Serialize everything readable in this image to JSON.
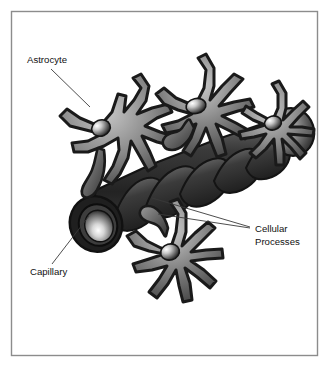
{
  "figure": {
    "border_color": "#8c8c8c",
    "background_color": "#ffffff",
    "labels": [
      {
        "id": "astrocyte",
        "text": "Astrocyte",
        "x": 27,
        "y": 63
      },
      {
        "id": "capillary",
        "text": "Capillary",
        "x": 30,
        "y": 275
      },
      {
        "id": "cellular-processes-line1",
        "text": "Cellular",
        "x": 255,
        "y": 232
      },
      {
        "id": "cellular-processes-line2",
        "text": "Processes",
        "x": 255,
        "y": 245
      }
    ],
    "leader_lines": [
      {
        "id": "astrocyte-leader",
        "x1": 51,
        "y1": 69,
        "x2": 90,
        "y2": 107
      },
      {
        "id": "capillary-leader",
        "x1": 52,
        "y1": 264,
        "x2": 89,
        "y2": 216
      },
      {
        "id": "processes-leader-upper",
        "x1": 250,
        "y1": 227,
        "x2": 152,
        "y2": 198
      },
      {
        "id": "processes-leader-lower",
        "x1": 250,
        "y1": 228,
        "x2": 158,
        "y2": 214
      }
    ],
    "colors": {
      "cell_outline": "#1c1c1c",
      "cell_body_light": "#b9b9b9",
      "cell_body_dark": "#4e4e4e",
      "capillary_dark": "#2a2a2a",
      "capillary_mid": "#565656",
      "nucleus_highlight": "#f2f2f2",
      "label_text": "#111111",
      "leader_line": "#3a3a3a"
    },
    "structures": {
      "astrocyte_count": 4,
      "capillary_label": "Capillary",
      "astrocyte_label": "Astrocyte",
      "processes_label": "Cellular Processes"
    }
  }
}
